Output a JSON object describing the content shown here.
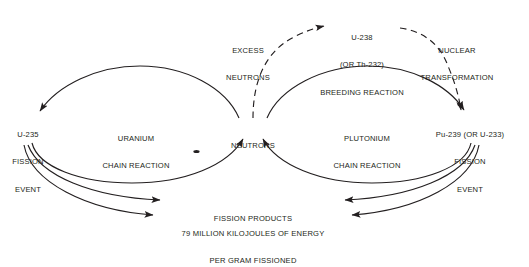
{
  "figure": {
    "type": "process-flow-diagram",
    "background_color": "#ffffff",
    "ink_color": "#231f20"
  },
  "nodes": {
    "u235": {
      "line1": "U-235",
      "line2": "FISSION",
      "line3": "EVENT"
    },
    "uranium_cycle": {
      "line1": "URANIUM",
      "line2": "CHAIN REACTION"
    },
    "neutrons": {
      "line1": "NEUTRONS"
    },
    "excess_neutrons": {
      "line1": "EXCESS",
      "line2": "NEUTRONS"
    },
    "breeding": {
      "line1": "U-238",
      "line2": "(OR Th-232)",
      "line3": "BREEDING REACTION"
    },
    "nuclear_transformation": {
      "line1": "NUCLEAR",
      "line2": "TRANSFORMATION"
    },
    "plutonium_cycle": {
      "line1": "PLUTONIUM",
      "line2": "CHAIN REACTION"
    },
    "pu239": {
      "line1": "Pu-239 (OR U-233)",
      "line2": "FISSION",
      "line3": "EVENT"
    },
    "fission_products": {
      "line1": "FISSION PRODUCTS"
    },
    "energy": {
      "line1": "79 MILLION KILOJOULES OF ENERGY",
      "line2": "PER GRAM FISSIONED"
    }
  },
  "edges": [
    {
      "name": "neutrons-to-u235",
      "style": "solid",
      "from": "neutrons",
      "to": "u235"
    },
    {
      "name": "u235-to-neutrons",
      "style": "solid",
      "from": "u235",
      "to": "neutrons"
    },
    {
      "name": "neutrons-to-breeding",
      "style": "dashed",
      "from": "neutrons",
      "to": "breeding"
    },
    {
      "name": "breeding-to-pu239",
      "style": "dashed",
      "from": "breeding",
      "to": "pu239"
    },
    {
      "name": "neutrons-to-pu239",
      "style": "solid",
      "from": "neutrons",
      "to": "pu239"
    },
    {
      "name": "pu239-to-neutrons",
      "style": "solid",
      "from": "pu239",
      "to": "neutrons"
    },
    {
      "name": "u235-to-fission-products",
      "style": "solid",
      "from": "u235",
      "to": "fission_products"
    },
    {
      "name": "u235-to-energy",
      "style": "solid",
      "from": "u235",
      "to": "energy"
    },
    {
      "name": "pu239-to-fission-products",
      "style": "solid",
      "from": "pu239",
      "to": "fission_products"
    },
    {
      "name": "pu239-to-energy",
      "style": "solid",
      "from": "pu239",
      "to": "energy"
    }
  ]
}
